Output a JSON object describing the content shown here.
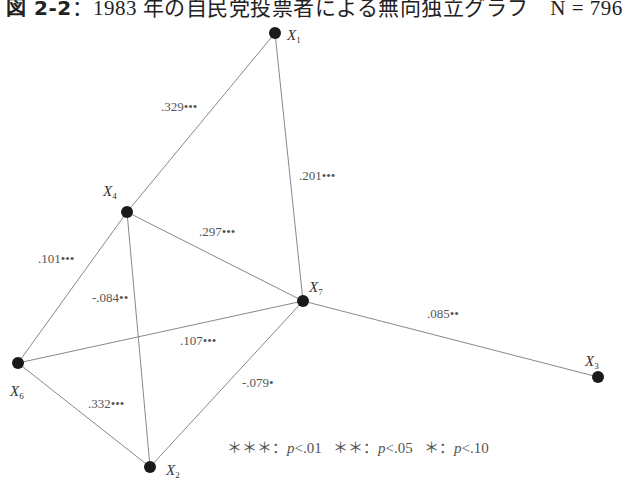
{
  "title": {
    "figure_label": "図 2-2",
    "text": "：1983 年の自民党投票者による無向独立グラフ　N = 796"
  },
  "nodes": [
    {
      "id": "X1",
      "label": "X",
      "sub": "1",
      "x": 275,
      "y": 33,
      "lx": 287,
      "ly": 40
    },
    {
      "id": "X4",
      "label": "X",
      "sub": "4",
      "x": 127,
      "y": 212,
      "lx": 103,
      "ly": 196
    },
    {
      "id": "X7",
      "label": "X",
      "sub": "7",
      "x": 303,
      "y": 301,
      "lx": 309,
      "ly": 292
    },
    {
      "id": "X3",
      "label": "X",
      "sub": "3",
      "x": 598,
      "y": 377,
      "lx": 585,
      "ly": 366
    },
    {
      "id": "X6",
      "label": "X",
      "sub": "6",
      "x": 18,
      "y": 363,
      "lx": 10,
      "ly": 396
    },
    {
      "id": "X2",
      "label": "X",
      "sub": "2",
      "x": 150,
      "y": 467,
      "lx": 166,
      "ly": 475
    }
  ],
  "edges": [
    {
      "from": "X1",
      "to": "X4",
      "weight": ".329•••",
      "lx": 161,
      "ly": 111
    },
    {
      "from": "X1",
      "to": "X7",
      "weight": ".201•••",
      "lx": 299,
      "ly": 180
    },
    {
      "from": "X4",
      "to": "X7",
      "weight": ".297•••",
      "lx": 199,
      "ly": 236
    },
    {
      "from": "X4",
      "to": "X6",
      "weight": ".101•••",
      "lx": 38,
      "ly": 263
    },
    {
      "from": "X4",
      "to": "X2",
      "weight": "-.084••",
      "lx": 92,
      "ly": 302
    },
    {
      "from": "X6",
      "to": "X7",
      "weight": ".107•••",
      "lx": 180,
      "ly": 345
    },
    {
      "from": "X7",
      "to": "X3",
      "weight": ".085••",
      "lx": 427,
      "ly": 318
    },
    {
      "from": "X7",
      "to": "X2",
      "weight": "-.079•",
      "lx": 242,
      "ly": 387
    },
    {
      "from": "X6",
      "to": "X2",
      "weight": ".332•••",
      "lx": 88,
      "ly": 408
    }
  ],
  "legend": {
    "items": [
      {
        "stars": "＊＊＊",
        "p": "p",
        "cond": "<.01"
      },
      {
        "stars": "＊＊",
        "p": "p",
        "cond": "<.05"
      },
      {
        "stars": "＊",
        "p": "p",
        "cond": "<.10"
      }
    ]
  }
}
